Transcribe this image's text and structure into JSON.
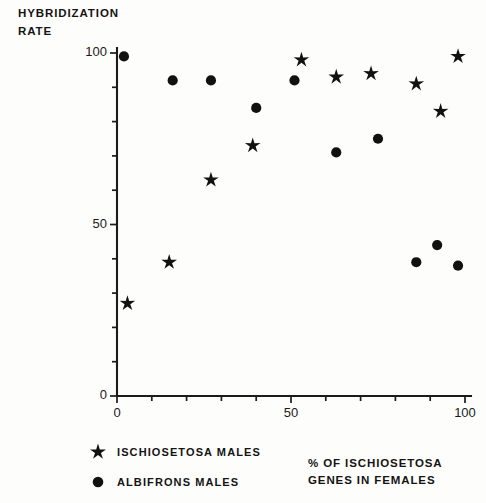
{
  "chart_data": {
    "type": "scatter",
    "title": "",
    "ylabel": "HYBRIDIZATION\nRATE",
    "xlabel": "% OF ISCHIOSETOSA\nGENES IN FEMALES",
    "xlim": [
      0,
      100
    ],
    "ylim": [
      0,
      100
    ],
    "x_major_ticks": [
      0,
      50,
      100
    ],
    "x_minor_ticks": [
      10,
      20,
      30,
      40,
      60,
      70,
      80,
      90
    ],
    "y_major_ticks": [
      0,
      50,
      100
    ],
    "y_minor_ticks": [
      10,
      20,
      30,
      40,
      60,
      70,
      80,
      90
    ],
    "x_tick_labels": [
      "0",
      "50",
      "100"
    ],
    "y_tick_labels": [
      "0",
      "50",
      "100"
    ],
    "grid": false,
    "legend_position": "below-left",
    "series": [
      {
        "name": "ISCHIOSETOSA MALES",
        "marker": "star",
        "color": "#111111",
        "points": [
          {
            "x": 3,
            "y": 27
          },
          {
            "x": 15,
            "y": 39
          },
          {
            "x": 27,
            "y": 63
          },
          {
            "x": 39,
            "y": 73
          },
          {
            "x": 53,
            "y": 98
          },
          {
            "x": 63,
            "y": 93
          },
          {
            "x": 73,
            "y": 94
          },
          {
            "x": 86,
            "y": 91
          },
          {
            "x": 93,
            "y": 83
          },
          {
            "x": 98,
            "y": 99
          }
        ]
      },
      {
        "name": "ALBIFRONS MALES",
        "marker": "circle",
        "color": "#111111",
        "points": [
          {
            "x": 2,
            "y": 99
          },
          {
            "x": 16,
            "y": 92
          },
          {
            "x": 27,
            "y": 92
          },
          {
            "x": 40,
            "y": 84
          },
          {
            "x": 51,
            "y": 92
          },
          {
            "x": 63,
            "y": 71
          },
          {
            "x": 75,
            "y": 75
          },
          {
            "x": 86,
            "y": 39
          },
          {
            "x": 92,
            "y": 44
          },
          {
            "x": 98,
            "y": 38
          }
        ]
      }
    ]
  },
  "legend": {
    "items": [
      {
        "label": "ISCHIOSETOSA MALES",
        "marker": "star"
      },
      {
        "label": "ALBIFRONS MALES",
        "marker": "circle"
      }
    ]
  },
  "axis_titles": {
    "y": "HYBRIDIZATION\nRATE",
    "x": "% OF ISCHIOSETOSA\nGENES IN FEMALES"
  }
}
